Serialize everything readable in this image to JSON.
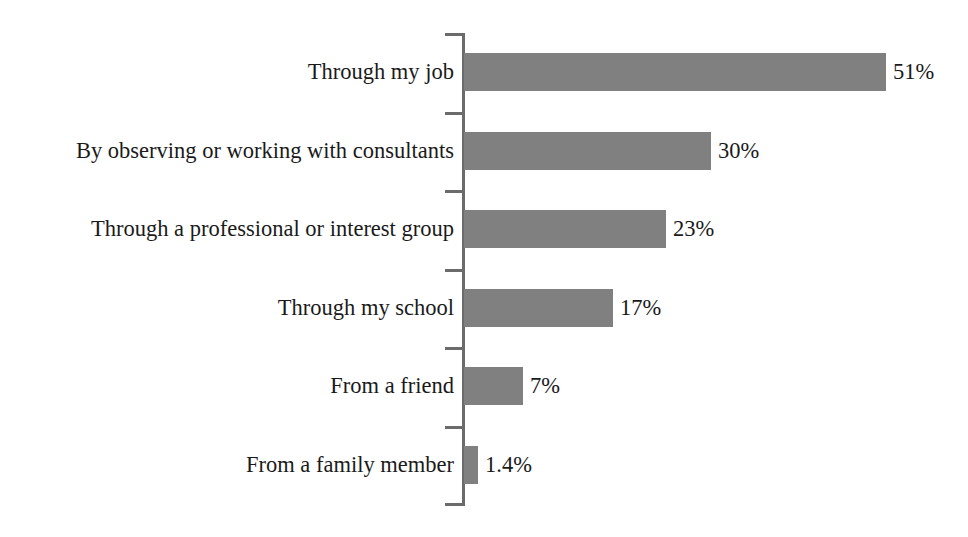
{
  "chart_data": {
    "type": "bar",
    "orientation": "horizontal",
    "title": "",
    "xlabel": "",
    "ylabel": "",
    "grid": false,
    "legend": null,
    "xlim": [
      0,
      51
    ],
    "axis_color": "#6b6b6b",
    "bar_color": "#808080",
    "background": "#ffffff",
    "categories": [
      "Through my job",
      "By observing or working with consultants",
      "Through a professional or interest group",
      "Through my school",
      "From a friend",
      "From a family member"
    ],
    "values": [
      51,
      30,
      23,
      17,
      7,
      1.4
    ],
    "value_labels": [
      "51%",
      "30%",
      "23%",
      "17%",
      "7%",
      "1.4%"
    ],
    "bar_pixel_widths": [
      422,
      247,
      202,
      149,
      59,
      14
    ]
  },
  "rows": [
    {
      "label": "Through my job",
      "value_label": "51%",
      "width": 422
    },
    {
      "label": "By observing or working with consultants",
      "value_label": "30%",
      "width": 247
    },
    {
      "label": "Through a professional or interest group",
      "value_label": "23%",
      "width": 202
    },
    {
      "label": "Through my school",
      "value_label": "17%",
      "width": 149
    },
    {
      "label": "From a friend",
      "value_label": "7%",
      "width": 59
    },
    {
      "label": "From a family member",
      "value_label": "1.4%",
      "width": 14
    }
  ]
}
